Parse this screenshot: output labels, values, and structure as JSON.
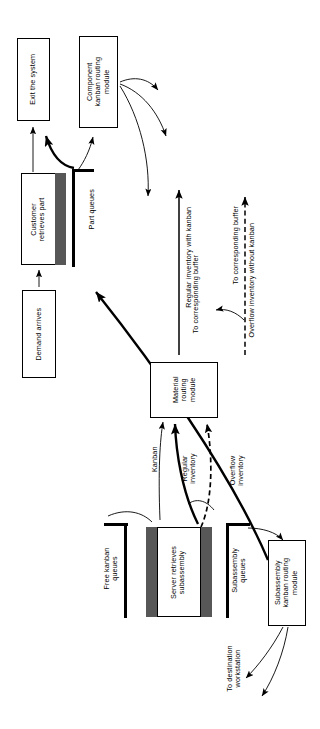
{
  "diagram": {
    "orientation": "rotated-90-ccw",
    "colors": {
      "stroke": "#000000",
      "background": "#ffffff",
      "shade": "#575757"
    },
    "nodes": [
      {
        "id": "exit-the-system",
        "label": "Exit the system"
      },
      {
        "id": "component-kanban-routing-module",
        "label": "Component\nkanban routing\nmodule"
      },
      {
        "id": "customer-retrieves-part",
        "label": "Customer\nretrieves part"
      },
      {
        "id": "demand-arrives",
        "label": "Demand arrives"
      },
      {
        "id": "material-routing-module",
        "label": "Material\nrouting\nmodule"
      },
      {
        "id": "server-retrieves-subassembly",
        "label": "Server retrieves\nsubassembly"
      },
      {
        "id": "subassembly-kanban-routing-module",
        "label": "Subassembly\nkanban routing\nmodule"
      }
    ],
    "queues": [
      {
        "id": "part-queues",
        "label": "Part queues"
      },
      {
        "id": "free-kanban-queues",
        "label": "Free kanban\nqueues"
      },
      {
        "id": "subassembly-queues",
        "label": "Subassembly\nqueues"
      }
    ],
    "edge_labels": [
      {
        "id": "regular-inventory-with-kanban",
        "label": "Regular inventory with kanban"
      },
      {
        "id": "to-corresponding-buffer-upper",
        "label": "To corresponding buffer"
      },
      {
        "id": "to-corresponding-buffer-lower",
        "label": "To corresponding buffer"
      },
      {
        "id": "overflow-inventory-without-kanban",
        "label": "Overflow inventory without kanban"
      },
      {
        "id": "kanban",
        "label": "Kanban"
      },
      {
        "id": "regular-inventory",
        "label": "Regular\ninventory"
      },
      {
        "id": "overflow-inventory",
        "label": "Overflow\ninventory"
      },
      {
        "id": "to-destination-workstation",
        "label": "To destination\nworkstation"
      }
    ],
    "node_text": {
      "exit_the_system": "Exit the system",
      "component_kanban_routing_module_l1": "Component",
      "component_kanban_routing_module_l2": "kanban routing",
      "component_kanban_routing_module_l3": "module",
      "customer_retrieves_part_l1": "Customer",
      "customer_retrieves_part_l2": "retrieves part",
      "demand_arrives": "Demand arrives",
      "material_routing_module_l1": "Material",
      "material_routing_module_l2": "routing",
      "material_routing_module_l3": "module",
      "server_retrieves_subassembly_l1": "Server retrieves",
      "server_retrieves_subassembly_l2": "subassembly",
      "subassembly_kanban_routing_module_l1": "Subassembly",
      "subassembly_kanban_routing_module_l2": "kanban routing",
      "subassembly_kanban_routing_module_l3": "module"
    },
    "queue_text": {
      "part_queues": "Part queues",
      "free_kanban_queues_l1": "Free kanban",
      "free_kanban_queues_l2": "queues",
      "subassembly_queues_l1": "Subassembly",
      "subassembly_queues_l2": "queues"
    },
    "edge_text": {
      "regular_inventory_with_kanban": "Regular inventory with kanban",
      "to_corresponding_buffer_upper": "To corresponding buffer",
      "to_corresponding_buffer_lower": "To corresponding buffer",
      "overflow_inventory_without_kanban": "Overflow inventory without kanban",
      "kanban": "Kanban",
      "regular_inventory_l1": "Regular",
      "regular_inventory_l2": "inventory",
      "overflow_inventory_l1": "Overflow",
      "overflow_inventory_l2": "inventory",
      "to_destination_workstation_l1": "To destination",
      "to_destination_workstation_l2": "workstation"
    }
  }
}
